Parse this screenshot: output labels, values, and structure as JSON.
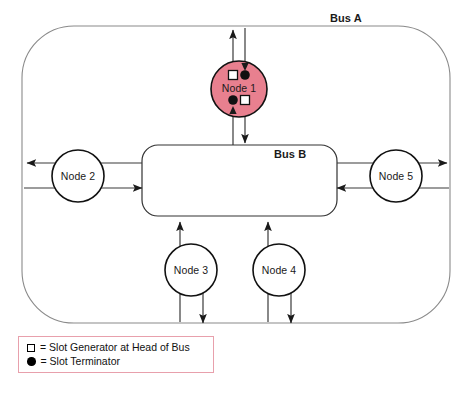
{
  "diagram": {
    "title_labels": {
      "bus_a": "Bus A",
      "bus_b": "Bus B"
    },
    "nodes": [
      {
        "id": "node1",
        "label": "Node 1",
        "highlight_color": "#e8808f",
        "highlighted": true
      },
      {
        "id": "node2",
        "label": "Node 2",
        "highlight_color": "#ffffff",
        "highlighted": false
      },
      {
        "id": "node3",
        "label": "Node 3",
        "highlight_color": "#ffffff",
        "highlighted": false
      },
      {
        "id": "node4",
        "label": "Node 4",
        "highlight_color": "#ffffff",
        "highlighted": false
      },
      {
        "id": "node5",
        "label": "Node 5",
        "highlight_color": "#ffffff",
        "highlighted": false
      }
    ],
    "legend": {
      "border_color": "#e8a0ac",
      "items": [
        {
          "marker": "white-square-icon",
          "text": "= Slot Generator at Head of Bus"
        },
        {
          "marker": "black-dot-icon",
          "text": "= Slot Terminator"
        }
      ]
    },
    "markers_on_node1": [
      {
        "type": "white-square-icon",
        "position": "top-left"
      },
      {
        "type": "black-dot-icon",
        "position": "top-right"
      },
      {
        "type": "black-dot-icon",
        "position": "bottom-left"
      },
      {
        "type": "white-square-icon",
        "position": "bottom-right"
      }
    ],
    "colors": {
      "bus_outline": "#8a8a8a",
      "line": "#333333",
      "node_stroke": "#111111"
    }
  }
}
